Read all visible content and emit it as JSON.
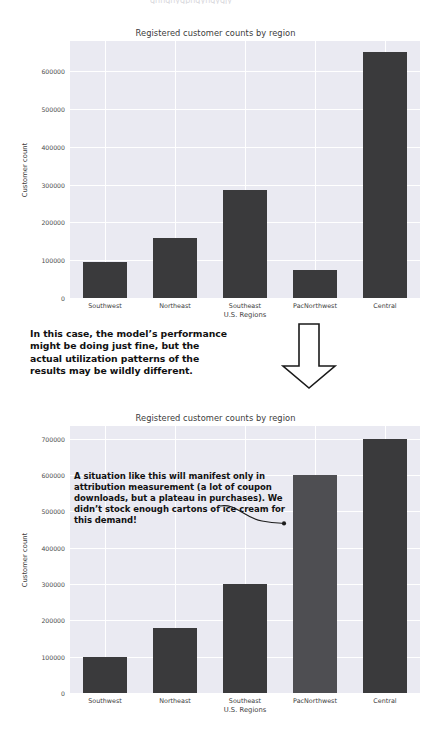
{
  "page": {
    "partial_top_text": "ghhghygphgyhgygjy"
  },
  "annotations": {
    "middle_note": "In this case, the model’s performance might be doing just fine, but the actual utilization patterns of the results may be wildly different.",
    "chart2_note": "A situation like this will manifest only in attribution measurement (a lot of coupon downloads, but a plateau in purchases). We didn’t stock enough cartons of ice cream for this demand!",
    "down_arrow_icon": "down-arrow-icon",
    "curved_arrow_icon": "curved-arrow-icon"
  },
  "colors": {
    "plot_background": "#eaeaf2",
    "gridline": "#ffffff",
    "bar": "#3a3a3c",
    "bar_highlight": "#4e4e52",
    "text": "#3c3c3c",
    "callout_text": "#111111"
  },
  "chart_data": [
    {
      "type": "bar",
      "id": "chart-top",
      "title": "Registered customer counts by region",
      "xlabel": "U.S. Regions",
      "ylabel": "Customer count",
      "categories": [
        "Southwest",
        "Northeast",
        "Southeast",
        "PacNorthwest",
        "Central"
      ],
      "values": [
        95000,
        160000,
        285000,
        75000,
        650000
      ],
      "ylim": [
        0,
        680000
      ],
      "yticks": [
        0,
        100000,
        200000,
        300000,
        400000,
        500000,
        600000
      ],
      "ytick_labels": [
        "0",
        "100000",
        "200000",
        "300000",
        "400000",
        "500000",
        "600000"
      ],
      "grid": true,
      "legend": false
    },
    {
      "type": "bar",
      "id": "chart-bottom",
      "title": "Registered customer counts by region",
      "xlabel": "U.S. Regions",
      "ylabel": "Customer count",
      "categories": [
        "Southwest",
        "Northeast",
        "Southeast",
        "PacNorthwest",
        "Central"
      ],
      "values": [
        98000,
        180000,
        300000,
        600000,
        700000
      ],
      "ylim": [
        0,
        735000
      ],
      "yticks": [
        0,
        100000,
        200000,
        300000,
        400000,
        500000,
        600000,
        700000
      ],
      "ytick_labels": [
        "0",
        "100000",
        "200000",
        "300000",
        "400000",
        "500000",
        "600000",
        "700000"
      ],
      "highlight_index": 3,
      "grid": true,
      "legend": false
    }
  ]
}
